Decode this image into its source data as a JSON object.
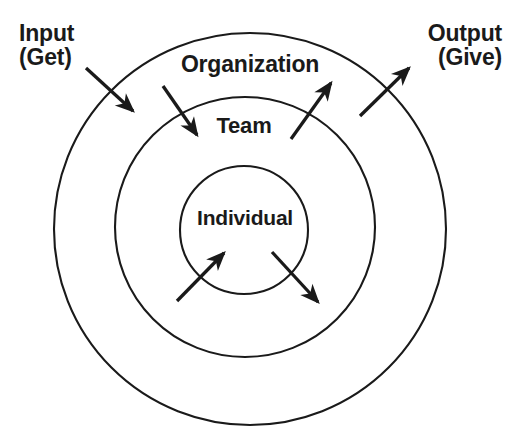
{
  "diagram": {
    "background_color": "#ffffff",
    "stroke_color": "#1a1a1a",
    "text_color": "#1a1a1a",
    "rings": [
      {
        "id": "outer",
        "label": "Organization",
        "center_x": 250,
        "center_y": 229,
        "radius": 196,
        "stroke_width": 2.1
      },
      {
        "id": "middle",
        "label": "Team",
        "center_x": 245,
        "center_y": 227,
        "radius": 130,
        "stroke_width": 2.1
      },
      {
        "id": "inner",
        "label": "Individual",
        "center_x": 244,
        "center_y": 230,
        "radius": 64,
        "stroke_width": 2.1
      }
    ],
    "io_labels": {
      "input": {
        "line1": "Input",
        "line2": "(Get)"
      },
      "output": {
        "line1": "Output",
        "line2": "(Give)"
      }
    },
    "arrows": [
      {
        "id": "input-to-organization",
        "direction": "inward",
        "x1": 86,
        "y1": 68,
        "x2": 133,
        "y2": 111
      },
      {
        "id": "organization-to-team",
        "direction": "inward",
        "x1": 163,
        "y1": 86,
        "x2": 197,
        "y2": 135
      },
      {
        "id": "individual-to-team",
        "direction": "outward",
        "x1": 291,
        "y1": 139,
        "x2": 331,
        "y2": 83
      },
      {
        "id": "team-to-organization",
        "direction": "outward",
        "x1": 360,
        "y1": 116,
        "x2": 409,
        "y2": 68
      },
      {
        "id": "into-individual",
        "direction": "inward-center",
        "x1": 177,
        "y1": 301,
        "x2": 224,
        "y2": 253
      },
      {
        "id": "out-of-individual",
        "direction": "outward-center",
        "x1": 272,
        "y1": 252,
        "x2": 318,
        "y2": 302
      }
    ]
  }
}
